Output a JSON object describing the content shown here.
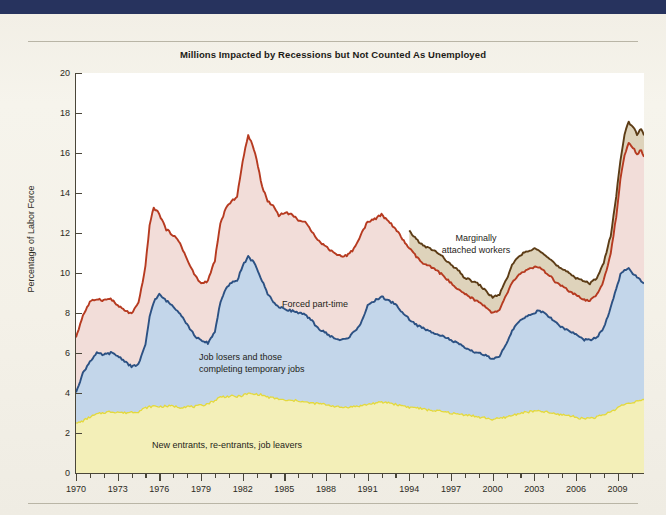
{
  "page": {
    "background_color": "#f4f2ea",
    "topbar_color": "#27335e"
  },
  "chart_title": "Millions Impacted by Recessions but Not Counted As Unemployed",
  "annotations": {
    "forced_part_time": "Forced part-time",
    "job_losers_line1": "Job losers and those",
    "job_losers_line2": "completing temporary jobs",
    "new_entrants": "New entrants, re-entrants, job leavers",
    "marginal_line1": "Marginally",
    "marginal_line2": "attached workers"
  },
  "axes": {
    "ylabel": "Percentage of Labor Force",
    "yticks": [
      0,
      2,
      4,
      6,
      8,
      10,
      12,
      14,
      16,
      18,
      20
    ],
    "ytick_labels": [
      "0",
      "2",
      "4",
      "6",
      "8",
      "10",
      "12",
      "14",
      "16",
      "18",
      "20"
    ],
    "xtick_labels": [
      "1970",
      "1973",
      "1976",
      "1979",
      "1982",
      "1985",
      "1988",
      "1991",
      "1994",
      "1997",
      "2000",
      "2003",
      "2006",
      "2009"
    ],
    "xtick_values": [
      1970,
      1973,
      1976,
      1979,
      1982,
      1985,
      1988,
      1991,
      1994,
      1997,
      2000,
      2003,
      2006,
      2009
    ]
  },
  "chart_data": {
    "type": "area",
    "title": "Millions Impacted by Recessions but Not Counted As Unemployed",
    "xlabel": "",
    "ylabel": "Percentage of Labor Force",
    "xlim": [
      1970,
      2010.9
    ],
    "ylim": [
      0,
      20
    ],
    "grid": false,
    "legend": "in-plot annotations",
    "stacked": true,
    "colors": {
      "new_entrants_fill": "#f3efb8",
      "new_entrants_line": "#e4d93c",
      "job_losers_fill": "#c3d6ea",
      "job_losers_line": "#2c5183",
      "forced_part_time_fill": "#f2ddd9",
      "forced_part_time_line": "#b63a20",
      "marginally_attached_fill": "#ded3bb",
      "marginally_attached_line": "#5c3c16"
    },
    "x": [
      1970.0,
      1970.5,
      1971.0,
      1971.5,
      1972.0,
      1972.5,
      1973.0,
      1973.5,
      1974.0,
      1974.5,
      1975.0,
      1975.3,
      1975.6,
      1976.0,
      1976.5,
      1977.0,
      1977.5,
      1978.0,
      1978.5,
      1979.0,
      1979.5,
      1980.0,
      1980.4,
      1980.8,
      1981.2,
      1981.6,
      1982.0,
      1982.4,
      1982.8,
      1983.0,
      1983.4,
      1983.8,
      1984.2,
      1984.6,
      1985.0,
      1985.5,
      1986.0,
      1986.5,
      1987.0,
      1987.5,
      1988.0,
      1988.5,
      1989.0,
      1989.5,
      1990.0,
      1990.5,
      1991.0,
      1991.5,
      1992.0,
      1992.5,
      1992.9,
      1993.3,
      1993.7,
      1994.0,
      1994.5,
      1995.0,
      1995.5,
      1996.0,
      1996.5,
      1997.0,
      1997.5,
      1998.0,
      1998.5,
      1999.0,
      1999.5,
      2000.0,
      2000.5,
      2001.0,
      2001.5,
      2002.0,
      2002.5,
      2003.0,
      2003.4,
      2003.8,
      2004.2,
      2004.6,
      2005.0,
      2005.5,
      2006.0,
      2006.5,
      2007.0,
      2007.5,
      2008.0,
      2008.5,
      2008.9,
      2009.2,
      2009.5,
      2009.8,
      2010.1,
      2010.4,
      2010.7,
      2010.9
    ],
    "series": [
      {
        "name": "New entrants, re-entrants, job leavers",
        "order": 1,
        "values": [
          2.45,
          2.6,
          2.8,
          2.95,
          3.0,
          3.05,
          3.05,
          3.0,
          3.05,
          3.1,
          3.25,
          3.3,
          3.35,
          3.3,
          3.35,
          3.35,
          3.3,
          3.3,
          3.3,
          3.35,
          3.45,
          3.65,
          3.8,
          3.8,
          3.85,
          3.8,
          3.9,
          3.95,
          3.95,
          3.95,
          3.9,
          3.8,
          3.75,
          3.7,
          3.65,
          3.6,
          3.6,
          3.55,
          3.5,
          3.45,
          3.4,
          3.35,
          3.3,
          3.3,
          3.3,
          3.35,
          3.45,
          3.5,
          3.5,
          3.5,
          3.45,
          3.4,
          3.35,
          3.3,
          3.25,
          3.2,
          3.15,
          3.1,
          3.05,
          3.0,
          2.95,
          2.9,
          2.85,
          2.8,
          2.75,
          2.7,
          2.7,
          2.8,
          2.9,
          3.0,
          3.05,
          3.1,
          3.1,
          3.05,
          3.0,
          2.95,
          2.9,
          2.85,
          2.8,
          2.75,
          2.75,
          2.8,
          2.9,
          3.05,
          3.2,
          3.35,
          3.45,
          3.5,
          3.55,
          3.6,
          3.65,
          3.65
        ]
      },
      {
        "name": "Job losers and those completing temporary jobs",
        "order": 2,
        "cumulative_values": [
          4.1,
          5.0,
          5.6,
          5.95,
          5.9,
          6.0,
          5.85,
          5.6,
          5.3,
          5.45,
          6.35,
          7.8,
          8.6,
          8.9,
          8.6,
          8.3,
          8.0,
          7.4,
          6.9,
          6.6,
          6.5,
          7.1,
          8.6,
          9.2,
          9.5,
          9.6,
          10.4,
          10.8,
          10.5,
          10.3,
          9.6,
          9.0,
          8.6,
          8.3,
          8.2,
          8.1,
          8.0,
          7.9,
          7.6,
          7.2,
          7.0,
          6.8,
          6.65,
          6.7,
          7.0,
          7.5,
          8.3,
          8.6,
          8.8,
          8.6,
          8.5,
          8.2,
          7.9,
          7.7,
          7.4,
          7.2,
          7.05,
          7.0,
          6.8,
          6.6,
          6.45,
          6.25,
          6.1,
          6.0,
          5.85,
          5.7,
          5.8,
          6.5,
          7.2,
          7.6,
          7.85,
          8.0,
          8.1,
          7.95,
          7.7,
          7.5,
          7.3,
          7.1,
          6.9,
          6.7,
          6.6,
          6.8,
          7.3,
          8.2,
          9.2,
          9.9,
          10.1,
          10.2,
          10.0,
          9.8,
          9.6,
          9.5
        ]
      },
      {
        "name": "Forced part-time",
        "order": 3,
        "cumulative_values": [
          6.8,
          7.9,
          8.5,
          8.7,
          8.6,
          8.7,
          8.4,
          8.1,
          8.0,
          8.5,
          10.3,
          12.4,
          13.3,
          13.0,
          12.2,
          11.9,
          11.5,
          10.7,
          10.0,
          9.5,
          9.6,
          10.6,
          12.5,
          13.3,
          13.6,
          13.8,
          15.6,
          16.9,
          16.2,
          15.7,
          14.3,
          13.6,
          13.4,
          12.9,
          13.0,
          12.9,
          12.7,
          12.5,
          12.1,
          11.6,
          11.3,
          11.1,
          10.9,
          10.9,
          11.2,
          11.9,
          12.6,
          12.7,
          12.9,
          12.6,
          12.3,
          11.9,
          11.5,
          11.2,
          10.8,
          10.5,
          10.3,
          10.1,
          9.8,
          9.5,
          9.2,
          8.9,
          8.7,
          8.5,
          8.3,
          8.0,
          8.1,
          8.9,
          9.6,
          10.0,
          10.2,
          10.3,
          10.2,
          10.0,
          9.8,
          9.5,
          9.3,
          9.1,
          8.9,
          8.7,
          8.6,
          8.9,
          9.6,
          11.0,
          12.8,
          14.6,
          15.9,
          16.5,
          16.3,
          15.9,
          16.2,
          15.8
        ]
      },
      {
        "name": "Marginally attached workers",
        "order": 4,
        "starts_year": 1994,
        "cumulative_values": [
          null,
          null,
          null,
          null,
          null,
          null,
          null,
          null,
          null,
          null,
          null,
          null,
          null,
          null,
          null,
          null,
          null,
          null,
          null,
          null,
          null,
          null,
          null,
          null,
          null,
          null,
          null,
          null,
          null,
          null,
          null,
          null,
          null,
          null,
          null,
          null,
          null,
          null,
          null,
          null,
          null,
          null,
          null,
          null,
          null,
          null,
          null,
          null,
          null,
          null,
          null,
          null,
          null,
          12.1,
          11.7,
          11.4,
          11.2,
          11.0,
          10.7,
          10.4,
          10.1,
          9.8,
          9.6,
          9.4,
          9.1,
          8.8,
          8.9,
          9.7,
          10.5,
          10.9,
          11.1,
          11.2,
          11.1,
          10.9,
          10.7,
          10.4,
          10.2,
          10.0,
          9.8,
          9.6,
          9.5,
          9.8,
          10.5,
          11.9,
          13.8,
          15.6,
          17.0,
          17.5,
          17.3,
          16.9,
          17.2,
          16.9
        ]
      }
    ]
  }
}
